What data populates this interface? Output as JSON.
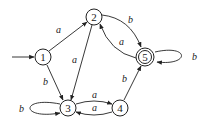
{
  "diagram": {
    "type": "finite-automaton",
    "states": [
      {
        "id": "1",
        "label": "1",
        "start": true,
        "accepting": false
      },
      {
        "id": "2",
        "label": "2",
        "start": false,
        "accepting": false
      },
      {
        "id": "3",
        "label": "3",
        "start": false,
        "accepting": false
      },
      {
        "id": "4",
        "label": "4",
        "start": false,
        "accepting": false
      },
      {
        "id": "5",
        "label": "5",
        "start": false,
        "accepting": true
      }
    ],
    "transitions": [
      {
        "from": "1",
        "to": "2",
        "label": "a"
      },
      {
        "from": "1",
        "to": "3",
        "label": "b"
      },
      {
        "from": "2",
        "to": "3",
        "label": "a"
      },
      {
        "from": "2",
        "to": "5",
        "label": "b"
      },
      {
        "from": "5",
        "to": "2",
        "label": "a"
      },
      {
        "from": "5",
        "to": "5",
        "label": "b"
      },
      {
        "from": "3",
        "to": "3",
        "label": "b"
      },
      {
        "from": "3",
        "to": "4",
        "label": "a"
      },
      {
        "from": "4",
        "to": "3",
        "label": "a"
      },
      {
        "from": "4",
        "to": "5",
        "label": "b"
      }
    ]
  }
}
